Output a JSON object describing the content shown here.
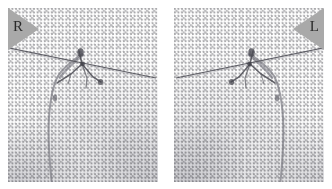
{
  "figure": {
    "type": "radiograph-pair",
    "modality_appearance": "halftone-printed x-ray film",
    "background_color": "#ffffff",
    "film_base_color": "#fcfcfc",
    "panel_count": 2,
    "panels": [
      {
        "id": "panel-right-breast",
        "side_label": "R",
        "side_name": "right",
        "marker_shape": "triangle-pointing-right",
        "marker_position": "top-left",
        "marker_color": "#a9a9a9",
        "letter_color": "#2a2a2a"
      },
      {
        "id": "panel-left-breast",
        "side_label": "L",
        "side_name": "left",
        "marker_shape": "triangle-pointing-left",
        "marker_position": "top-right",
        "marker_color": "#a9a9a9",
        "letter_color": "#2a2a2a"
      }
    ],
    "features": {
      "wire_color": "#58585e",
      "outline_color": "#6e6e76",
      "cluster_color": "#4a4a52"
    }
  }
}
